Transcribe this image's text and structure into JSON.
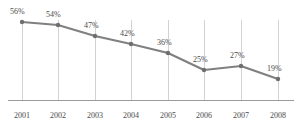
{
  "chart_data": {
    "type": "line",
    "title": "",
    "subtitle": "",
    "xlabel": "",
    "ylabel": "",
    "categories": [
      "2001",
      "2002",
      "2003",
      "2004",
      "2005",
      "2006",
      "2007",
      "2008"
    ],
    "values": [
      56,
      54,
      47,
      42,
      36,
      25,
      27,
      19
    ],
    "value_labels": [
      "56%",
      "54%",
      "47%",
      "42%",
      "36%",
      "25%",
      "27%",
      "19%"
    ],
    "ylim": [
      0,
      60
    ],
    "grid": "vertical-only",
    "legend": "none",
    "series": [
      {
        "name": "",
        "values": [
          56,
          54,
          47,
          42,
          36,
          25,
          27,
          19
        ]
      }
    ],
    "colors": {
      "line": "#808080",
      "marker": "#6e6e6e",
      "gridline": "#d2d2d2",
      "axis": "#9a9a9a",
      "label_text": "#4a4a4a",
      "background": "#ffffff"
    },
    "geometry": {
      "points": [
        {
          "x": 22,
          "y": 22
        },
        {
          "x": 58,
          "y": 25
        },
        {
          "x": 95,
          "y": 36
        },
        {
          "x": 131,
          "y": 44
        },
        {
          "x": 168,
          "y": 53
        },
        {
          "x": 204,
          "y": 70
        },
        {
          "x": 241,
          "y": 66
        },
        {
          "x": 278,
          "y": 79
        }
      ],
      "label_offsets": [
        {
          "x": 10,
          "y": 7
        },
        {
          "x": 46,
          "y": 10
        },
        {
          "x": 84,
          "y": 21
        },
        {
          "x": 120,
          "y": 29
        },
        {
          "x": 157,
          "y": 38
        },
        {
          "x": 193,
          "y": 55
        },
        {
          "x": 230,
          "y": 51
        },
        {
          "x": 267,
          "y": 64
        }
      ],
      "gridline_top": 20,
      "gridline_bottom": 100,
      "axis_y": 100
    }
  }
}
